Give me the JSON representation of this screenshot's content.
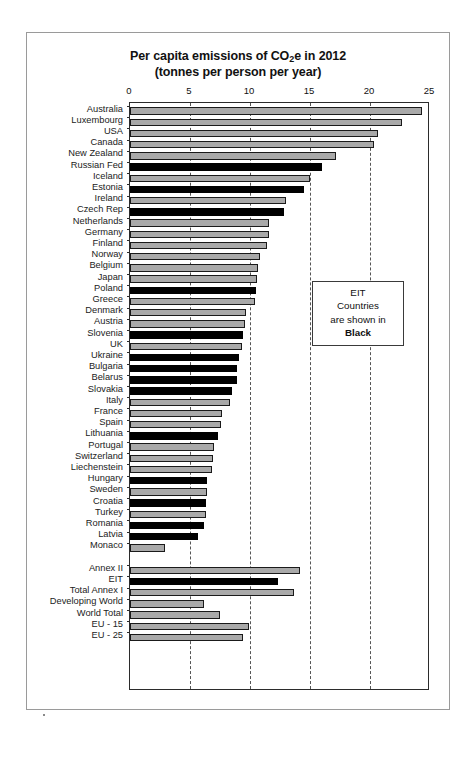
{
  "chart_data": {
    "type": "bar",
    "orientation": "horizontal",
    "subtitle": "(tonnes per person per year)",
    "title_line1_pre": "Per capita emissions of CO",
    "title_line1_sub": "2",
    "title_line1_post": "e in 2012",
    "xlabel": "",
    "ylabel": "",
    "xlim": [
      0,
      25
    ],
    "xticks": [
      0,
      5,
      10,
      15,
      20,
      25
    ],
    "xtick_labels": [
      "0",
      "5",
      "10",
      "15",
      "20",
      "25"
    ],
    "grid": "vertical-dashed",
    "legend": {
      "position": "inside-right",
      "line1": "EIT",
      "line2": "Countries",
      "line3": "are shown in",
      "line4": "Black"
    },
    "series_colors": {
      "default": "#a9a9a9",
      "eit": "#000000",
      "outline": "#1a1a1a"
    },
    "categories": [
      "Australia",
      "Luxembourg",
      "USA",
      "Canada",
      "New Zealand",
      "Russian Fed",
      "Iceland",
      "Estonia",
      "Ireland",
      "Czech Rep",
      "Netherlands",
      "Germany",
      "Finland",
      "Norway",
      "Belgium",
      "Japan",
      "Poland",
      "Greece",
      "Denmark",
      "Austria",
      "Slovenia",
      "UK",
      "Ukraine",
      "Bulgaria",
      "Belarus",
      "Slovakia",
      "Italy",
      "France",
      "Spain",
      "Lithuania",
      "Portugal",
      "Switzerland",
      "Liechenstein",
      "Hungary",
      "Sweden",
      "Croatia",
      "Turkey",
      "Romania",
      "Latvia",
      "Monaco",
      "",
      "Annex II",
      "EIT",
      "Total Annex I",
      "Developing World",
      "World Total",
      "EU - 15",
      "EU - 25"
    ],
    "values": [
      24.3,
      22.7,
      20.7,
      20.3,
      17.2,
      16.0,
      15.0,
      14.5,
      13.0,
      12.8,
      11.6,
      11.6,
      11.4,
      10.8,
      10.7,
      10.6,
      10.5,
      10.4,
      9.7,
      9.6,
      9.4,
      9.3,
      9.1,
      8.9,
      8.9,
      8.5,
      8.3,
      7.7,
      7.6,
      7.3,
      7.0,
      6.9,
      6.8,
      6.4,
      6.4,
      6.3,
      6.3,
      6.2,
      5.7,
      2.9,
      null,
      14.2,
      12.3,
      13.7,
      6.2,
      7.5,
      9.9,
      9.4
    ],
    "eit_flags": [
      false,
      false,
      false,
      false,
      false,
      true,
      false,
      true,
      false,
      true,
      false,
      false,
      false,
      false,
      false,
      false,
      true,
      false,
      false,
      false,
      true,
      false,
      true,
      true,
      true,
      true,
      false,
      false,
      false,
      true,
      false,
      false,
      false,
      true,
      false,
      true,
      false,
      true,
      true,
      false,
      false,
      false,
      true,
      false,
      false,
      false,
      false,
      false
    ]
  }
}
